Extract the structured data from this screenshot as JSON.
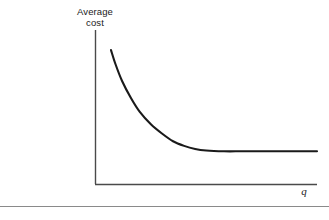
{
  "figure": {
    "background_color": "#ffffff",
    "ink_color": "#1a1a1a",
    "rule_color": "#8a8a8a",
    "y_axis_label_line1": "Average",
    "y_axis_label_line2": "cost",
    "x_axis_label": "q"
  },
  "chart_data": {
    "type": "line",
    "title": "",
    "subtitle": "",
    "xlabel": "q",
    "ylabel": "Average cost",
    "grid": false,
    "legend": null,
    "axis_style": "open-lshaped-no-ticks",
    "ticks": {
      "x": [],
      "y": []
    },
    "xlim": [
      0,
      100
    ],
    "ylim": [
      0,
      100
    ],
    "annotations": [],
    "series": [
      {
        "name": "Average cost",
        "description": "L-shaped long-run average cost curve: steeply declining then constant at a minimum-efficient-scale plateau",
        "x": [
          7,
          9,
          12,
          16,
          20,
          25,
          30,
          35,
          40,
          45,
          50,
          58,
          66,
          75,
          85,
          95,
          100
        ],
        "y": [
          87,
          78,
          67,
          56,
          47,
          39,
          33,
          28,
          25,
          23,
          22,
          21.5,
          21.5,
          21.5,
          21.5,
          21.5,
          21.5
        ]
      }
    ]
  }
}
